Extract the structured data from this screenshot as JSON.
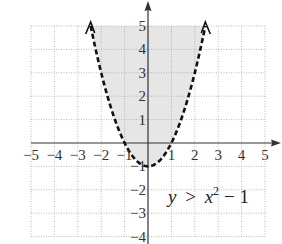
{
  "chart_data": {
    "type": "line",
    "title": "",
    "equation": {
      "lhs": "y",
      "op": ">",
      "base": "x",
      "exp": "2",
      "rest": "− 1"
    },
    "function": "y = x^2 - 1",
    "inequality": "y > x^2 - 1",
    "boundary_style": "dashed",
    "shaded_region": "above",
    "xlim": [
      -5,
      5
    ],
    "ylim": [
      -4,
      5
    ],
    "grid": true,
    "x_ticks": [
      "−5",
      "−4",
      "−3",
      "−2",
      "−1",
      "1",
      "2",
      "3",
      "4",
      "5"
    ],
    "x_tick_values": [
      -5,
      -4,
      -3,
      -2,
      -1,
      1,
      2,
      3,
      4,
      5
    ],
    "y_ticks": [
      "5",
      "4",
      "3",
      "2",
      "1",
      "−1",
      "−2",
      "−3",
      "−4"
    ],
    "y_tick_values": [
      5,
      4,
      3,
      2,
      1,
      -1,
      -2,
      -3,
      -4
    ],
    "series": [
      {
        "name": "y = x^2 - 1",
        "x": [
          -2.45,
          -2,
          -1.5,
          -1,
          -0.5,
          0,
          0.5,
          1,
          1.5,
          2,
          2.45
        ],
        "y": [
          5.0,
          3,
          1.25,
          0,
          -0.75,
          -1,
          -0.75,
          0,
          1.25,
          3,
          5.0
        ]
      }
    ],
    "colors": {
      "shade": "#e6e6e6",
      "curve": "#111111",
      "grid": "#aaaaaa",
      "axis": "#333333"
    }
  }
}
